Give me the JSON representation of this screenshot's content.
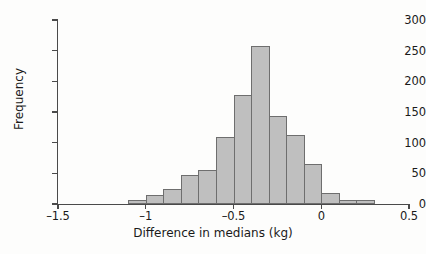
{
  "chart_data": {
    "type": "bar",
    "title": "",
    "xlabel": "Difference in medians (kg)",
    "ylabel": "Frequency",
    "xlim": [
      -1.5,
      0.5
    ],
    "ylim": [
      0,
      300
    ],
    "xticks": [
      -1.5,
      -1,
      -0.5,
      0,
      0.5
    ],
    "xtick_labels": [
      "–1.5",
      "–1",
      "–0.5",
      "0",
      "0.5"
    ],
    "yticks": [
      0,
      50,
      100,
      150,
      200,
      250,
      300
    ],
    "ytick_labels": [
      "0",
      "50",
      "100",
      "150",
      "200",
      "250",
      "300"
    ],
    "grid": false,
    "legend": false,
    "bin_width": 0.1,
    "bin_edges": [
      -1.1,
      -1.0,
      -0.9,
      -0.8,
      -0.7,
      -0.6,
      -0.5,
      -0.4,
      -0.3,
      -0.2,
      -0.1,
      0.0,
      0.1,
      0.2,
      0.3
    ],
    "categories": [
      "-1.1 to -1.0",
      "-1.0 to -0.9",
      "-0.9 to -0.8",
      "-0.8 to -0.7",
      "-0.7 to -0.6",
      "-0.6 to -0.5",
      "-0.5 to -0.4",
      "-0.4 to -0.3",
      "-0.3 to -0.2",
      "-0.2 to -0.1",
      "-0.1 to 0.0",
      "0.0 to 0.1",
      "0.1 to 0.2",
      "0.2 to 0.3"
    ],
    "values": [
      7,
      15,
      24,
      48,
      56,
      110,
      178,
      258,
      143,
      113,
      65,
      18,
      7,
      6
    ],
    "bar_fill_color": "#bfbfbf",
    "bar_edge_color": "#6e6e6e",
    "axis_color": "#4a4a4a"
  }
}
